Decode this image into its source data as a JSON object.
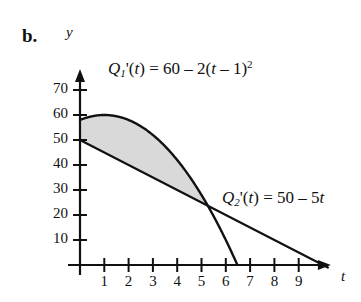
{
  "figure": {
    "label": "b.",
    "background": "#ffffff",
    "ink_color": "#111111",
    "shade_color": "#d9d9d9"
  },
  "axes": {
    "x_name": "t",
    "y_name": "y",
    "x_ticks": [
      1,
      2,
      3,
      4,
      5,
      6,
      7,
      8,
      9
    ],
    "y_ticks": [
      10,
      20,
      30,
      40,
      50,
      60,
      70
    ],
    "x_range": [
      0,
      10.2
    ],
    "y_range": [
      0,
      78
    ],
    "origin_px": {
      "x": 80,
      "y": 265
    },
    "x_unit_px": 24.3,
    "y_unit_px": 2.5
  },
  "labels": {
    "q1_parts": {
      "name": "Q",
      "sub": "1",
      "prime_arg": "'(t) = 60 ",
      "minus": "– 2(",
      "var": "t",
      "tail": " – 1)",
      "exp": "2"
    },
    "q2_parts": {
      "name": "Q",
      "sub": "2",
      "prime_arg": "'(t) = 50 ",
      "minus": "– 5",
      "var": "t"
    },
    "q1_text": "Q1'(t) = 60 – 2(t – 1)²",
    "q2_text": "Q2'(t) = 50 – 5t"
  },
  "chart_data": {
    "type": "line",
    "title": "",
    "xlabel": "t",
    "ylabel": "y",
    "xlim": [
      0,
      10.2
    ],
    "ylim": [
      0,
      78
    ],
    "grid": false,
    "legend": "inline-annotations",
    "xticks": [
      1,
      2,
      3,
      4,
      5,
      6,
      7,
      8,
      9
    ],
    "yticks": [
      10,
      20,
      30,
      40,
      50,
      60,
      70
    ],
    "series": [
      {
        "name": "Q1'(t) = 60 - 2(t - 1)^2",
        "kind": "parabola",
        "equation": "y = 60 - 2*(t-1)^2",
        "coefficients": {
          "a": -2,
          "vertex_t": 1,
          "vertex_y": 60
        },
        "y_intercept": 58,
        "x_intercept": 6.477,
        "t_domain": [
          0,
          6.477
        ],
        "points": [
          {
            "t": 0,
            "y": 58
          },
          {
            "t": 1,
            "y": 60
          },
          {
            "t": 2,
            "y": 58
          },
          {
            "t": 3,
            "y": 52
          },
          {
            "t": 4,
            "y": 42
          },
          {
            "t": 5,
            "y": 28
          },
          {
            "t": 6,
            "y": 10
          },
          {
            "t": 6.477,
            "y": 0
          }
        ]
      },
      {
        "name": "Q2'(t) = 50 - 5t",
        "kind": "line",
        "equation": "y = 50 - 5t",
        "coefficients": {
          "slope": -5,
          "intercept": 50
        },
        "y_intercept": 50,
        "x_intercept": 10,
        "t_domain": [
          0,
          10.2
        ],
        "points": [
          {
            "t": 0,
            "y": 50
          },
          {
            "t": 5,
            "y": 25
          },
          {
            "t": 9,
            "y": 5
          },
          {
            "t": 10,
            "y": 0
          }
        ]
      }
    ],
    "shaded_region": {
      "description": "Region between Q1' (upper) and Q2' (lower) from t = 0 to the intersection",
      "color": "#d9d9d9",
      "t_from": 0,
      "t_to": 5.317,
      "upper_series": "Q1'(t) = 60 - 2(t - 1)^2",
      "lower_series": "Q2'(t) = 50 - 5t"
    },
    "intersection": {
      "t": 5.317,
      "y": 23.4
    }
  }
}
